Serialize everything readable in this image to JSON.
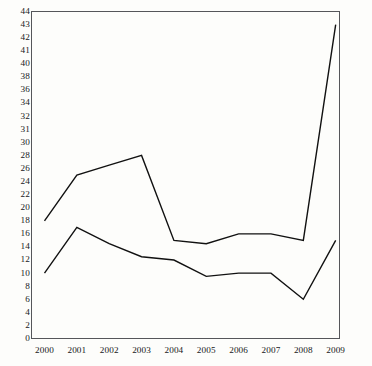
{
  "chart_data": {
    "type": "line",
    "title": "",
    "subtitle": "",
    "xlabel": "",
    "ylabel": "",
    "categories": [
      "2000",
      "2001",
      "2002",
      "2003",
      "2004",
      "2005",
      "2006",
      "2007",
      "2008",
      "2009"
    ],
    "series": [
      {
        "name": "series-1",
        "color": "#111111",
        "values": [
          18,
          25,
          26.5,
          28,
          15,
          14.5,
          16,
          16,
          15,
          43
        ]
      },
      {
        "name": "series-2",
        "color": "#111111",
        "values": [
          10,
          17,
          14.5,
          12.5,
          12,
          9.5,
          10,
          10,
          6,
          15
        ]
      }
    ],
    "ytick_labels": [
      "0",
      "2",
      "4",
      "6",
      "8",
      "10",
      "12",
      "14",
      "16",
      "18",
      "20",
      "22",
      "24",
      "26",
      "28",
      "30",
      "31",
      "32",
      "34",
      "36",
      "38",
      "40",
      "41",
      "42",
      "43",
      "44"
    ],
    "ytick_values": [
      0,
      2,
      4,
      6,
      8,
      10,
      12,
      14,
      16,
      18,
      20,
      22,
      24,
      26,
      28,
      30,
      31,
      32,
      34,
      36,
      38,
      40,
      41,
      42,
      43,
      44
    ],
    "xtick_labels": [
      "2000",
      "2001",
      "2002",
      "2003",
      "2004",
      "2005",
      "2006",
      "2007",
      "2008",
      "2009"
    ],
    "grid": false,
    "legend": "none",
    "axis_color": "#55565a",
    "background_color": "#fdfdfb",
    "line_width": 1.4
  }
}
